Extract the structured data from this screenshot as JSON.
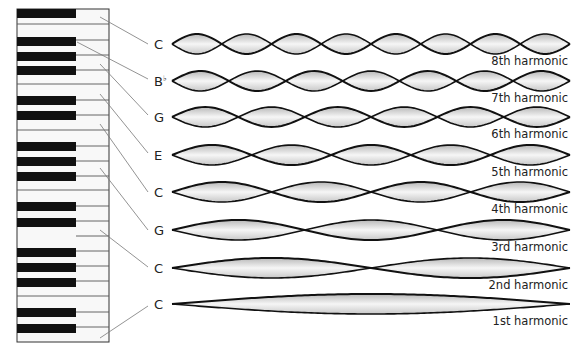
{
  "diagram": {
    "colors": {
      "white_key": "#f8f8f8",
      "black_key": "#111111",
      "key_divider": "#555555",
      "leader_line": "#777777",
      "wave_stroke": "#111111",
      "wave_fill_center": "#f6f6f6",
      "wave_fill_edge": "#b8b8b8",
      "text": "#222222"
    },
    "keyboard": {
      "x": 17,
      "y": 9,
      "width": 92,
      "height": 333,
      "white_key_dividers_y": [
        24,
        84,
        130,
        190,
        251,
        296
      ],
      "white_key_lines_y": [
        24,
        40,
        55,
        70,
        84,
        100,
        115,
        130,
        146,
        161,
        176,
        190,
        206,
        221,
        236,
        251,
        266,
        281,
        296,
        312,
        327
      ],
      "black_keys_y": [
        9,
        37,
        52,
        66,
        96,
        111,
        142,
        157,
        172,
        202,
        218,
        248,
        263,
        278,
        308,
        324
      ],
      "black_key_width": 59,
      "black_key_height": 9
    },
    "harmonics": [
      {
        "note": "C",
        "accidental": "",
        "label": "8th harmonic",
        "n": 8,
        "y": 44,
        "key_point": [
          100,
          17
        ],
        "label_point": [
          148,
          44
        ]
      },
      {
        "note": "B",
        "accidental": "♭",
        "label": "7th harmonic",
        "n": 7,
        "y": 81,
        "key_point": [
          77,
          42
        ],
        "label_point": [
          148,
          79
        ]
      },
      {
        "note": "G",
        "accidental": "",
        "label": "6th harmonic",
        "n": 6,
        "y": 117,
        "key_point": [
          100,
          64
        ],
        "label_point": [
          148,
          115
        ]
      },
      {
        "note": "E",
        "accidental": "",
        "label": "5th harmonic",
        "n": 5,
        "y": 155,
        "key_point": [
          100,
          94
        ],
        "label_point": [
          148,
          153
        ]
      },
      {
        "note": "C",
        "accidental": "",
        "label": "4th harmonic",
        "n": 4,
        "y": 192,
        "key_point": [
          100,
          124
        ],
        "label_point": [
          148,
          192
        ]
      },
      {
        "note": "G",
        "accidental": "",
        "label": "3rd harmonic",
        "n": 3,
        "y": 230,
        "key_point": [
          100,
          168
        ],
        "label_point": [
          148,
          230
        ]
      },
      {
        "note": "C",
        "accidental": "",
        "label": "2nd harmonic",
        "n": 2,
        "y": 268,
        "key_point": [
          100,
          230
        ],
        "label_point": [
          148,
          267
        ]
      },
      {
        "note": "C",
        "accidental": "",
        "label": "1st harmonic",
        "n": 1,
        "y": 304,
        "key_point": [
          100,
          338
        ],
        "label_point": [
          148,
          306
        ]
      }
    ],
    "wave": {
      "x_start": 172,
      "x_end": 570,
      "amplitude_by_n": {
        "8": 10,
        "7": 10,
        "6": 10,
        "5": 10,
        "4": 10,
        "3": 10,
        "2": 10,
        "1": 10
      }
    }
  }
}
